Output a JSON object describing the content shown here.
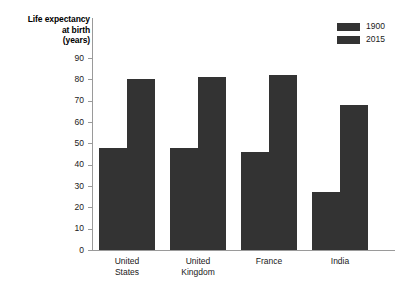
{
  "chart_data": {
    "type": "bar",
    "title": "",
    "xlabel": "",
    "ylabel": "Life expectancy at birth (years)",
    "ylim": [
      0,
      90
    ],
    "ytick_step": 10,
    "grid": false,
    "legend_position": "top-right",
    "categories": [
      "United States",
      "United Kingdom",
      "France",
      "India"
    ],
    "category_lines": [
      [
        "United",
        "States"
      ],
      [
        "United",
        "Kingdom"
      ],
      [
        "France",
        ""
      ],
      [
        "India",
        ""
      ]
    ],
    "series": [
      {
        "name": "1900",
        "color": "#333333",
        "values": [
          48,
          48,
          46,
          27
        ]
      },
      {
        "name": "2015",
        "color": "#333333",
        "values": [
          80,
          81,
          82,
          68
        ]
      }
    ],
    "yticks": [
      90,
      80,
      70,
      60,
      50,
      40,
      30,
      20,
      10,
      0
    ]
  },
  "axis": {
    "y_title_lines": [
      "Life expectancy",
      "at birth",
      "(years)"
    ],
    "line_color": "#9a9a9a"
  },
  "legend": {
    "items": [
      {
        "label": "1900"
      },
      {
        "label": "2015"
      }
    ]
  }
}
